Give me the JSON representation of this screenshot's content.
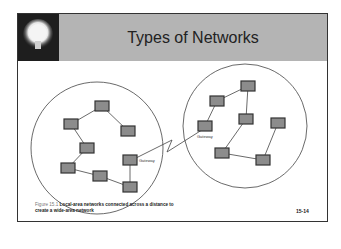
{
  "slide": {
    "title": "Types of Networks",
    "page_number": "15-14",
    "caption_figure": "Figure 15.1",
    "caption_line1": "Local-area networks connected across a distance to",
    "caption_line2": "create a wide-area network"
  },
  "diagram": {
    "left_gateway_label": "Gateway",
    "right_gateway_label": "Gateway"
  },
  "colors": {
    "header_bg": "#b4b4b4",
    "bulb_bg": "#1e1e1e",
    "node_fill": "#8c8c8c",
    "node_border": "#333333"
  }
}
